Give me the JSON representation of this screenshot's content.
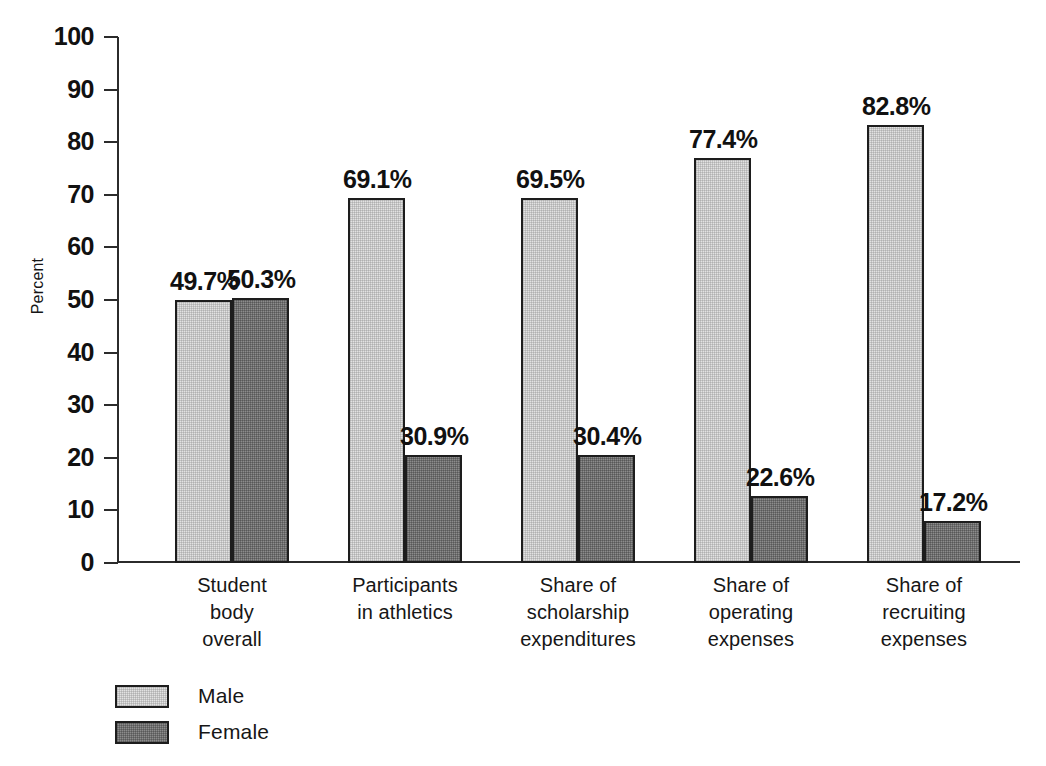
{
  "chart_data": {
    "type": "bar",
    "title": "",
    "xlabel": "",
    "ylabel": "Percent",
    "ylim": [
      0,
      100
    ],
    "yticks": [
      0,
      10,
      20,
      30,
      40,
      50,
      60,
      70,
      80,
      90,
      100
    ],
    "ytick_labels": [
      "0",
      "10",
      "20",
      "30",
      "40",
      "50",
      "60",
      "70",
      "80",
      "90",
      "100"
    ],
    "grid": false,
    "legend_position": "bottom-left",
    "categories": [
      "Student body overall",
      "Participants in athletics",
      "Share of scholarship expenditures",
      "Share of operating expenses",
      "Share of recruiting expenses"
    ],
    "category_lines": [
      [
        "Student",
        "body",
        "overall"
      ],
      [
        "Participants",
        "in athletics"
      ],
      [
        "Share of",
        "scholarship",
        "expenditures"
      ],
      [
        "Share of",
        "operating",
        "expenses"
      ],
      [
        "Share of",
        "recruiting",
        "expenses"
      ]
    ],
    "series": [
      {
        "name": "Male",
        "color": "#e2e2e2",
        "values": [
          49.7,
          69.1,
          69.5,
          77.4,
          82.8
        ],
        "labels": [
          "49.7%",
          "69.1%",
          "69.5%",
          "77.4%",
          "82.8%"
        ],
        "drawn_heights": [
          50.0,
          69.3,
          69.3,
          77.0,
          83.2
        ]
      },
      {
        "name": "Female",
        "color": "#8c8c8c",
        "values": [
          50.3,
          30.9,
          30.4,
          22.6,
          17.2
        ],
        "labels": [
          "50.3%",
          "30.9%",
          "30.4%",
          "22.6%",
          "17.2%"
        ],
        "drawn_heights": [
          50.3,
          20.5,
          20.5,
          12.8,
          7.9
        ]
      }
    ]
  },
  "axis": {
    "y_title": "Percent"
  },
  "legend": {
    "items": [
      {
        "label": "Male",
        "swatch": "male-swatch"
      },
      {
        "label": "Female",
        "swatch": "female-swatch"
      }
    ]
  }
}
